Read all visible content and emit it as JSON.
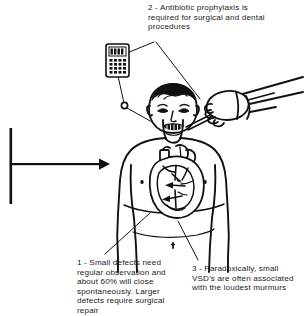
{
  "illustration": {
    "title": "Ventricular septal defect (VSD) illustration",
    "subject": "Child torso with heart showing ventricular septal defect, dentist hand with instrument, and handheld device",
    "background_color": "#ffffff",
    "line_color": "#000000",
    "text_color": "#1a1a1a"
  },
  "annotations": [
    {
      "number": "1",
      "id": "caption-small-defects",
      "text": "1 - Small defects need regular observation and about 60% will close spontaneously. Larger defects require surgical repair",
      "percent_value": "60%",
      "position": "bottom-left"
    },
    {
      "number": "2",
      "id": "caption-antibiotic-prophylaxis",
      "text": "2 - Antibiotic prophylaxis is required for surgical and dental procedures",
      "position": "top-center"
    },
    {
      "number": "3",
      "id": "caption-murmurs",
      "text": "3 - Paradoxically, small VSD's are often associated with the loudest murmurs",
      "position": "bottom-right"
    }
  ],
  "figures": {
    "patient": "child-torso-figure",
    "heart": "heart-with-vsd-shunt-arrows",
    "hand": "gloved-hand-with-dental-instrument",
    "device": "handheld-medication-device",
    "marker": "injection-site-marker",
    "pointer": "left-leader-arrow"
  }
}
